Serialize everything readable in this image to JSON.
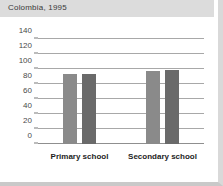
{
  "title": "Colombia, 1995",
  "chart_data": {
    "type": "bar",
    "title": "Colombia, 1995",
    "xlabel": "",
    "ylabel": "",
    "categories": [
      "Primary school",
      "Secondary school"
    ],
    "series": [
      {
        "name": "series-1",
        "color": "#8a8a8a",
        "values": [
          93,
          98
        ]
      },
      {
        "name": "series-2",
        "color": "#6a6a6a",
        "values": [
          94,
          99
        ]
      }
    ],
    "yticks": [
      0,
      20,
      40,
      60,
      80,
      100,
      120,
      140
    ],
    "ytick_labels": [
      "0",
      "20",
      "40",
      "60",
      "80",
      "100",
      "120",
      "140"
    ],
    "ylim": [
      0,
      152
    ],
    "grid": true,
    "legend": "none"
  },
  "colors": {
    "background": "#ffffff",
    "title_strip": "#dcdcdc",
    "gridline": "#a8a8a8",
    "axis": "#8f8f8f",
    "bar_light": "#8a8a8a",
    "bar_dark": "#6a6a6a",
    "text": "#1d1d1d"
  }
}
